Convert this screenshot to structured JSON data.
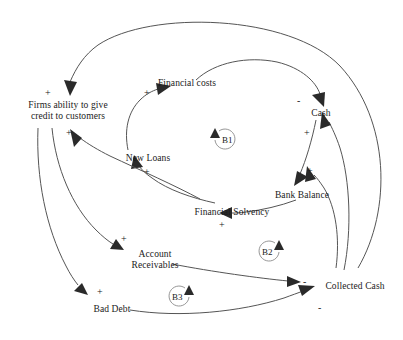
{
  "diagram": {
    "type": "causal-loop-diagram",
    "background_color": "#ffffff",
    "line_color": "#555555",
    "text_color": "#1a1a1a"
  },
  "nodes": [
    {
      "id": "firms_ability",
      "label": "Firms ability to give\ncredit to customers",
      "x": 10,
      "y": 100
    },
    {
      "id": "financial_costs",
      "label": "Financial costs",
      "x": 145,
      "y": 78
    },
    {
      "id": "cash",
      "label": "Cash",
      "x": 305,
      "y": 108
    },
    {
      "id": "new_loans",
      "label": "New Loans",
      "x": 115,
      "y": 153
    },
    {
      "id": "bank_balance",
      "label": "Bank Balance",
      "x": 268,
      "y": 190
    },
    {
      "id": "financial_solvency",
      "label": "Financial Solvency",
      "x": 186,
      "y": 208
    },
    {
      "id": "account_receivables",
      "label": "Account\nReceivables",
      "x": 128,
      "y": 250
    },
    {
      "id": "bad_debt",
      "label": "Bad Debt",
      "x": 84,
      "y": 305
    },
    {
      "id": "collected_cash",
      "label": "Collected Cash",
      "x": 320,
      "y": 282
    }
  ],
  "links": [
    {
      "from": "financial_solvency",
      "to": "firms_ability",
      "sign": "+"
    },
    {
      "from": "collected_cash",
      "to": "firms_ability",
      "sign": "+"
    },
    {
      "from": "new_loans",
      "to": "financial_costs",
      "sign": "+"
    },
    {
      "from": "financial_costs",
      "to": "cash",
      "sign": "-"
    },
    {
      "from": "financial_solvency",
      "to": "new_loans",
      "sign": "+"
    },
    {
      "from": "cash",
      "to": "bank_balance",
      "sign": "+"
    },
    {
      "from": "collected_cash",
      "to": "cash",
      "sign": "+"
    },
    {
      "from": "bank_balance",
      "to": "financial_solvency",
      "sign": "+"
    },
    {
      "from": "firms_ability",
      "to": "account_receivables",
      "sign": "+"
    },
    {
      "from": "firms_ability",
      "to": "bad_debt",
      "sign": "+"
    },
    {
      "from": "account_receivables",
      "to": "collected_cash",
      "sign": "-"
    },
    {
      "from": "bad_debt",
      "to": "collected_cash",
      "sign": "-"
    }
  ],
  "signs": [
    {
      "text": "+",
      "x": 45,
      "y": 88,
      "name": "sign-into-firms-ability-top"
    },
    {
      "text": "+",
      "x": 66,
      "y": 128,
      "name": "sign-into-firms-ability-lower"
    },
    {
      "text": "+",
      "x": 144,
      "y": 88,
      "name": "sign-into-financial-costs"
    },
    {
      "text": "-",
      "x": 297,
      "y": 98,
      "name": "sign-into-cash-from-financial-costs"
    },
    {
      "text": "+",
      "x": 144,
      "y": 167,
      "name": "sign-into-new-loans"
    },
    {
      "text": "+",
      "x": 304,
      "y": 128,
      "name": "sign-cash-to-bank-balance"
    },
    {
      "text": "+",
      "x": 307,
      "y": 168,
      "name": "sign-into-bank-balance"
    },
    {
      "text": "+",
      "x": 219,
      "y": 222,
      "name": "sign-into-financial-solvency"
    },
    {
      "text": "+",
      "x": 121,
      "y": 235,
      "name": "sign-into-account-receivables"
    },
    {
      "text": "+",
      "x": 97,
      "y": 287,
      "name": "sign-into-bad-debt"
    },
    {
      "text": "-",
      "x": 303,
      "y": 279,
      "name": "sign-into-collected-cash-from-receivables"
    },
    {
      "text": "-",
      "x": 318,
      "y": 305,
      "name": "sign-into-collected-cash-from-bad-debt"
    }
  ],
  "loops": [
    {
      "id": "B1",
      "label": "B1",
      "x": 225,
      "y": 138,
      "direction": "clockwise"
    },
    {
      "id": "B2",
      "label": "B2",
      "x": 268,
      "y": 250,
      "direction": "counterclockwise"
    },
    {
      "id": "B3",
      "label": "B3",
      "x": 178,
      "y": 295,
      "direction": "counterclockwise"
    }
  ]
}
